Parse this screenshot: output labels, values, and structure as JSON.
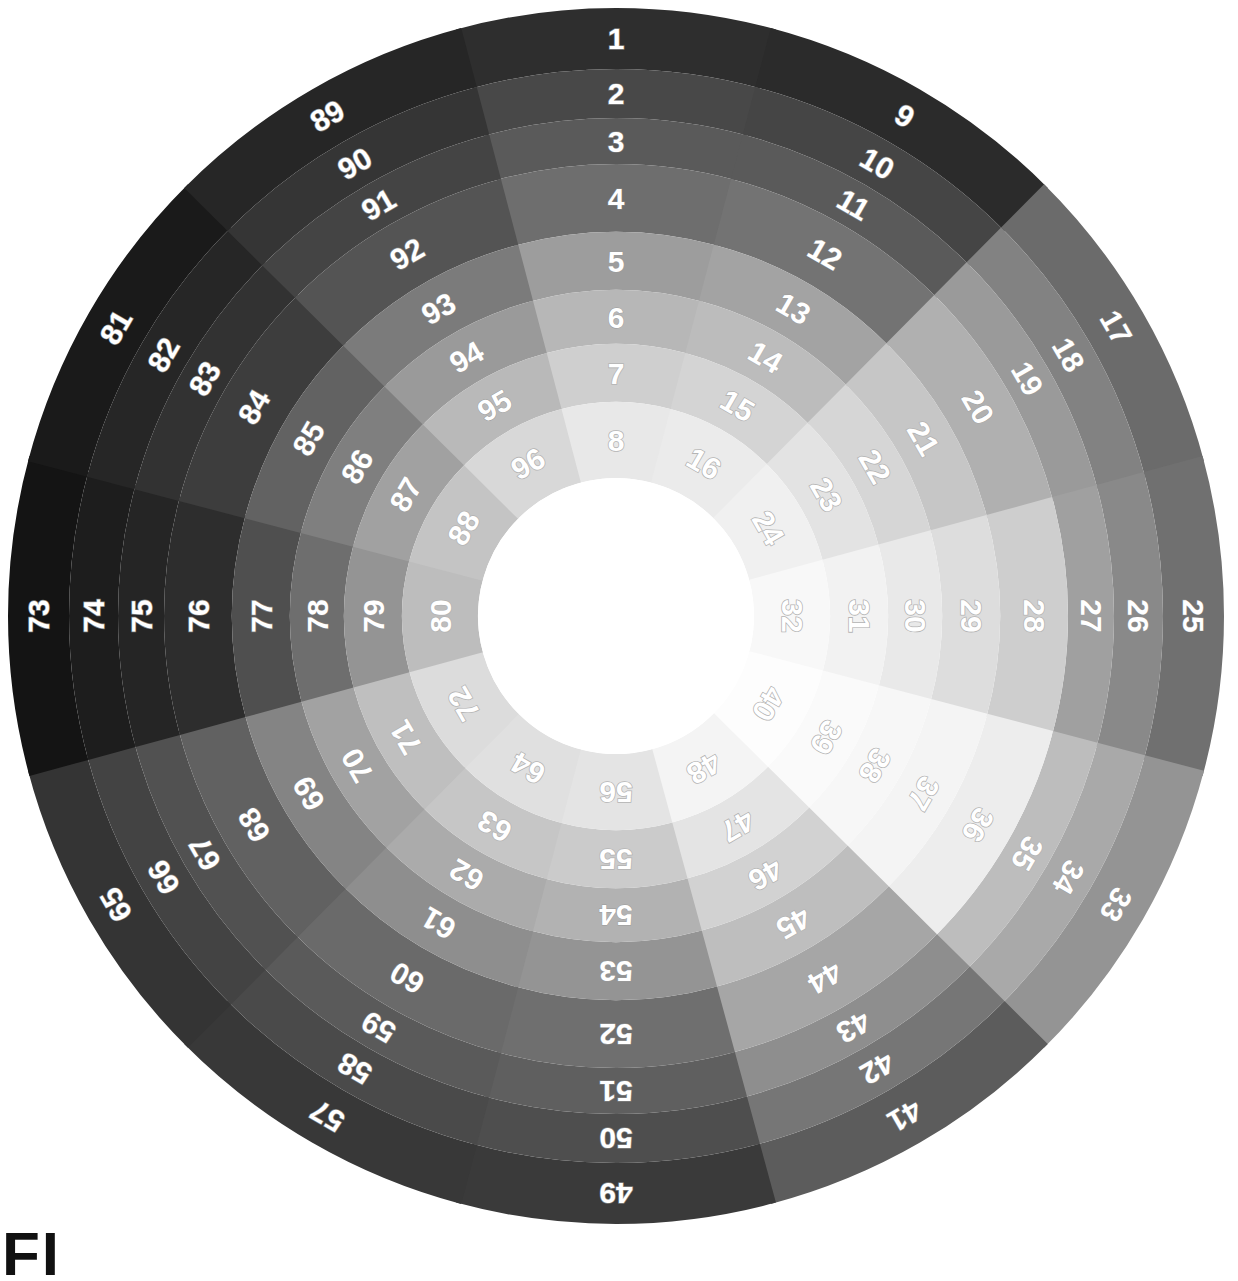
{
  "figure": {
    "kind": "radial-color-chart",
    "corner_mark": "FI",
    "background": "#ffffff",
    "center_x": 616,
    "center_y": 616,
    "outer_radius": 608,
    "inner_hole_radius": 138,
    "sector_count": 12,
    "ring_count": 8,
    "patch_count": 96,
    "sector_span_degrees": 30,
    "first_sector_start_degrees": -15,
    "numbering": "clockwise by sector; within each sector outermost ring = lowest number"
  },
  "chart_data": {
    "type": "heatmap",
    "xlabel": "sector",
    "ylabel": "ring",
    "grid": false,
    "legend": "none",
    "categories": [
      "S1",
      "S2",
      "S3",
      "S4",
      "S5",
      "S6",
      "S7",
      "S8",
      "S9",
      "S10",
      "S11",
      "S12"
    ],
    "ring_labels": [
      "R1 (outer)",
      "R2",
      "R3",
      "R4",
      "R5",
      "R6",
      "R7",
      "R8 (inner)"
    ],
    "ring_radii": [
      608,
      547,
      498,
      452,
      384,
      326,
      272,
      214,
      138
    ],
    "sectors": [
      {
        "index": 1,
        "start_deg": -15,
        "end_deg": 15,
        "numbers": [
          1,
          2,
          3,
          4,
          5,
          6,
          7,
          8
        ],
        "colors": [
          "#2e2e2e",
          "#484848",
          "#5a5a5a",
          "#6e6e6e",
          "#9d9d9d",
          "#b7b7b7",
          "#cfcfcf",
          "#e8e8e8"
        ]
      },
      {
        "index": 2,
        "start_deg": 15,
        "end_deg": 45,
        "numbers": [
          9,
          10,
          11,
          12,
          13,
          14,
          15,
          16
        ],
        "colors": [
          "#2b2b2b",
          "#454545",
          "#5a5a5a",
          "#737373",
          "#a3a3a3",
          "#bcbcbc",
          "#d4d4d4",
          "#ebebeb"
        ]
      },
      {
        "index": 3,
        "start_deg": 45,
        "end_deg": 75,
        "numbers": [
          17,
          18,
          19,
          20,
          21,
          22,
          23,
          24
        ],
        "colors": [
          "#6b6b6b",
          "#828282",
          "#9a9a9a",
          "#b0b0b0",
          "#c6c6c6",
          "#d6d6d6",
          "#e3e3e3",
          "#f0f0f0"
        ]
      },
      {
        "index": 4,
        "start_deg": 75,
        "end_deg": 105,
        "numbers": [
          25,
          26,
          27,
          28,
          29,
          30,
          31,
          32
        ],
        "colors": [
          "#707070",
          "#898989",
          "#a0a0a0",
          "#cecece",
          "#dddddd",
          "#e9e9e9",
          "#f2f2f2",
          "#f8f8f8"
        ]
      },
      {
        "index": 5,
        "start_deg": 105,
        "end_deg": 135,
        "numbers": [
          33,
          34,
          35,
          36,
          37,
          38,
          39,
          40
        ],
        "colors": [
          "#949494",
          "#a9a9a9",
          "#bdbdbd",
          "#ededed",
          "#f4f4f4",
          "#f7f7f7",
          "#fafafa",
          "#fdfdfd"
        ]
      },
      {
        "index": 6,
        "start_deg": 135,
        "end_deg": 165,
        "numbers": [
          41,
          42,
          43,
          44,
          45,
          46,
          47,
          48
        ],
        "colors": [
          "#5c5c5c",
          "#767676",
          "#8e8e8e",
          "#a6a6a6",
          "#bebebe",
          "#d2d2d2",
          "#e4e4e4",
          "#f4f4f4"
        ]
      },
      {
        "index": 7,
        "start_deg": 165,
        "end_deg": 195,
        "numbers": [
          49,
          50,
          51,
          52,
          53,
          54,
          55,
          56
        ],
        "colors": [
          "#3a3a3a",
          "#4e4e4e",
          "#5f5f5f",
          "#6f6f6f",
          "#949494",
          "#b2b2b2",
          "#cbcbcb",
          "#e4e4e4"
        ]
      },
      {
        "index": 8,
        "start_deg": 195,
        "end_deg": 225,
        "numbers": [
          57,
          58,
          59,
          60,
          61,
          62,
          63,
          64
        ],
        "colors": [
          "#383838",
          "#4a4a4a",
          "#5a5a5a",
          "#6a6a6a",
          "#8e8e8e",
          "#ababab",
          "#c6c6c6",
          "#e0e0e0"
        ]
      },
      {
        "index": 9,
        "start_deg": 225,
        "end_deg": 255,
        "numbers": [
          65,
          66,
          67,
          68,
          69,
          70,
          71,
          72
        ],
        "colors": [
          "#343434",
          "#434343",
          "#515151",
          "#616161",
          "#848484",
          "#a2a2a2",
          "#bfbfbf",
          "#dcdcdc"
        ]
      },
      {
        "index": 10,
        "start_deg": 255,
        "end_deg": 285,
        "numbers": [
          73,
          74,
          75,
          76,
          77,
          78,
          79,
          80
        ],
        "colors": [
          "#141414",
          "#1d1d1d",
          "#252525",
          "#2d2d2d",
          "#4f4f4f",
          "#6e6e6e",
          "#949494",
          "#bdbdbd"
        ]
      },
      {
        "index": 11,
        "start_deg": 285,
        "end_deg": 315,
        "numbers": [
          81,
          82,
          83,
          84,
          85,
          86,
          87,
          88
        ],
        "colors": [
          "#1a1a1a",
          "#262626",
          "#323232",
          "#3d3d3d",
          "#626262",
          "#7f7f7f",
          "#a1a1a1",
          "#c4c4c4"
        ]
      },
      {
        "index": 12,
        "start_deg": 315,
        "end_deg": 345,
        "numbers": [
          89,
          90,
          91,
          92,
          93,
          94,
          95,
          96
        ],
        "colors": [
          "#262626",
          "#353535",
          "#444444",
          "#545454",
          "#7b7b7b",
          "#9a9a9a",
          "#b9b9b9",
          "#d8d8d8"
        ]
      }
    ]
  }
}
